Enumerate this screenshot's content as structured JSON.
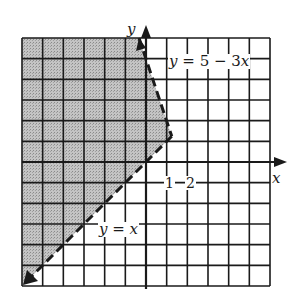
{
  "chart_data": {
    "type": "region",
    "title": "",
    "xlabel": "x",
    "ylabel": "y",
    "xlim": [
      -6,
      6
    ],
    "ylim": [
      -6,
      6
    ],
    "grid": true,
    "grid_step": 1,
    "tick_labels": [
      "1",
      "2"
    ],
    "lines": [
      {
        "name": "y = 5 - 3x",
        "label": "y = 5 − 3x",
        "style": "dashed",
        "points": [
          [
            -0.333,
            6
          ],
          [
            1.25,
            1.25
          ]
        ]
      },
      {
        "name": "y = x",
        "label": "y = x",
        "style": "dashed",
        "arrow": true,
        "points": [
          [
            1.25,
            1.25
          ],
          [
            -6,
            -6
          ]
        ]
      }
    ],
    "shaded_region": {
      "description": "y > x and y < 5 - 3x",
      "vertices": [
        [
          -6,
          6
        ],
        [
          -0.333,
          6
        ],
        [
          1.25,
          1.25
        ],
        [
          -6,
          -6
        ]
      ],
      "color": "#b8b8b8"
    },
    "vertex": [
      1.25,
      1.25
    ]
  },
  "labels": {
    "x_axis": "x",
    "y_axis": "y",
    "tick_1": "1",
    "tick_2": "2",
    "line1": "y = 5 − 3x",
    "line2": "y = x"
  },
  "colors": {
    "ink": "#1a1a1a",
    "shade": "#b8b8b8",
    "background": "#ffffff"
  }
}
